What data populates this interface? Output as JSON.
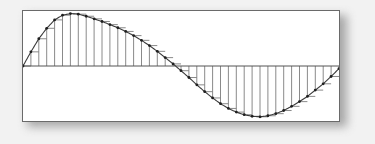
{
  "figure": {
    "background_color": "#f2f2f2",
    "frame_fill": "#ffffff",
    "frame_border_color": "#6a6a6a",
    "shadow_color": "#8e8e8e",
    "caption": ""
  },
  "chart_data": {
    "type": "line",
    "title": "",
    "subtitle": "",
    "xlabel": "",
    "ylabel": "",
    "grid": false,
    "legend": null,
    "legend_position": "none",
    "axis_line_color": "#555555",
    "curve_color": "#3a3a3a",
    "stem_color": "#7d7d7d",
    "marker_color": "#1f1f1f",
    "marker_shape": "dot",
    "xlim": [
      0,
      40
    ],
    "ylim": [
      -1.05,
      1.05
    ],
    "zero_axis_y": 0,
    "sample_count": 41,
    "x": [
      0,
      1,
      2,
      3,
      4,
      5,
      6,
      7,
      8,
      9,
      10,
      11,
      12,
      13,
      14,
      15,
      16,
      17,
      18,
      19,
      20,
      21,
      22,
      23,
      24,
      25,
      26,
      27,
      28,
      29,
      30,
      31,
      32,
      33,
      34,
      35,
      36,
      37,
      38,
      39,
      40
    ],
    "xticklabels": [],
    "yticklabels": [],
    "series": [
      {
        "name": "sampled sine",
        "values": [
          0.0,
          0.27,
          0.52,
          0.72,
          0.88,
          0.97,
          1.0,
          0.99,
          0.95,
          0.9,
          0.85,
          0.79,
          0.73,
          0.66,
          0.58,
          0.49,
          0.39,
          0.28,
          0.16,
          0.04,
          -0.09,
          -0.22,
          -0.36,
          -0.49,
          -0.61,
          -0.72,
          -0.81,
          -0.88,
          -0.93,
          -0.96,
          -0.97,
          -0.95,
          -0.91,
          -0.85,
          -0.77,
          -0.68,
          -0.58,
          -0.46,
          -0.34,
          -0.2,
          -0.05
        ]
      }
    ]
  }
}
